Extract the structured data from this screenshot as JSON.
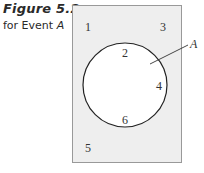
{
  "caption": {
    "figure_label": "Figure 5.2",
    "subtitle_prefix": "for Event ",
    "subtitle_event": "A"
  },
  "diagram": {
    "type": "venn",
    "sample_space_fill": "#eeeeee",
    "sample_space_border": "#999999",
    "event_fill": "#ffffff",
    "event_border": "#222222",
    "event_label": "A",
    "outside_outcomes": [
      {
        "value": "1",
        "x": 88,
        "y": 30
      },
      {
        "value": "3",
        "x": 163,
        "y": 30
      },
      {
        "value": "5",
        "x": 88,
        "y": 150
      }
    ],
    "inside_outcomes": [
      {
        "value": "2",
        "x": 125,
        "y": 55
      },
      {
        "value": "4",
        "x": 159,
        "y": 89
      },
      {
        "value": "6",
        "x": 125,
        "y": 123
      }
    ]
  }
}
